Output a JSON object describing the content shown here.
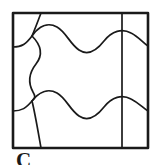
{
  "figure": {
    "background_color": "#ffffff",
    "stroke_color": "#1a1a1a",
    "frame": {
      "name": "outer-square-frame",
      "x": 13,
      "y": 13,
      "width": 135,
      "height": 135,
      "stroke_width": 2.6
    },
    "inner_vertical_line": {
      "name": "inner-vertical-divider",
      "x": 122,
      "y_start": 13,
      "y_end": 148,
      "stroke_width": 1.7
    },
    "curves": [
      {
        "name": "top-wave",
        "description": "horizontal wavy curve running near the top edge",
        "path": "M 13,47 C 22,47 26,44 32,36 C 39,26 48,22 57,27 C 66,32 70,44 79,50 C 88,56 97,50 104,41 C 112,31 122,28 131,33 C 139,37 143,43 148,46"
      },
      {
        "name": "bottom-wave",
        "description": "horizontal wavy curve running near the bottom edge",
        "path": "M 13,111 C 22,111 26,108 32,101 C 39,92 48,88 57,93 C 66,98 70,110 79,116 C 88,122 97,116 104,107 C 112,97 122,94 131,99 C 139,103 143,108 148,111"
      },
      {
        "name": "left-s-curve",
        "description": "vertical S-shaped curve on the left side",
        "path": "M 32,36 C 40,46 42,55 36,64 C 30,73 28,82 33,91 C 38,99 40,95 32,101"
      },
      {
        "name": "top-left-corner-curve",
        "description": "short curve from top edge down to the wave crest",
        "path": "M 41,13 C 38,20 35,28 32,36"
      },
      {
        "name": "top-left-edge-curve",
        "description": "short curve from the left frame edge to the wave",
        "path": "M 13,47 C 20,47 27,42 32,36"
      },
      {
        "name": "bottom-left-corner-curve",
        "description": "short curve from the bottom wave down to the bottom edge",
        "path": "M 32,101 C 35,112 38,130 41,148"
      },
      {
        "name": "bottom-left-edge-curve",
        "description": "short curve from the left frame edge to the bottom wave",
        "path": "M 13,111 C 20,111 27,106 32,101"
      },
      {
        "name": "top-right-tail",
        "description": "tail of the top wave meeting the right frame edge",
        "path": "M 131,33 C 139,37 143,43 148,46"
      },
      {
        "name": "bottom-right-tail",
        "description": "tail of the bottom wave meeting the right frame edge",
        "path": "M 131,99 C 139,103 143,108 148,111"
      }
    ]
  },
  "caption": {
    "name": "figure-caption",
    "text": "C",
    "note": "partially cropped letter below the figure"
  }
}
